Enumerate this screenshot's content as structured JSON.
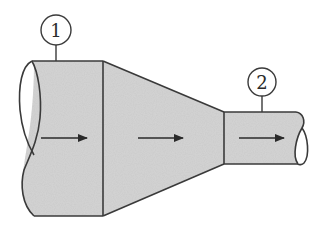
{
  "diagram": {
    "type": "pipe-reducer-flow",
    "colors": {
      "fill": "#d6d6d6",
      "stroke": "#3a3a3a",
      "background": "#ffffff"
    },
    "sections": [
      {
        "id": "section-1",
        "label": "1"
      },
      {
        "id": "section-2",
        "label": "2"
      }
    ],
    "flow_arrows": [
      {
        "region": "large-pipe",
        "direction": "right"
      },
      {
        "region": "reducer",
        "direction": "right"
      },
      {
        "region": "small-pipe",
        "direction": "right"
      }
    ]
  }
}
